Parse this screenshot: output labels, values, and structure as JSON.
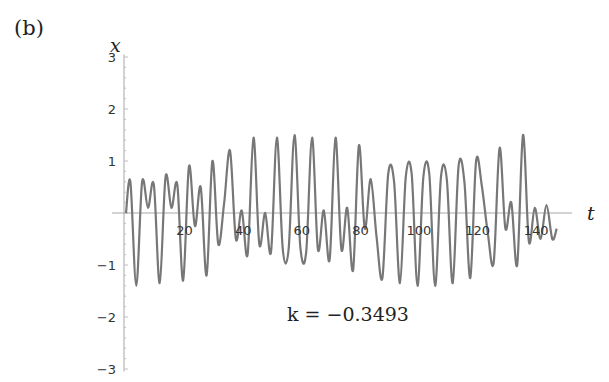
{
  "panel_label": "(b)",
  "chart_data": {
    "type": "line",
    "title": "",
    "xlabel": "t",
    "ylabel": "x",
    "xlim": [
      0,
      150
    ],
    "ylim": [
      -3,
      3
    ],
    "x_ticks": [
      20,
      40,
      60,
      80,
      100,
      120,
      140
    ],
    "y_ticks": [
      -3,
      -2,
      -1,
      1,
      2,
      3
    ],
    "grid": false,
    "legend": null,
    "annotation": "k = −0.3493",
    "series": [
      {
        "name": "x(t)",
        "color": "#777777",
        "description": "Quasi-periodic oscillation; amplitude ~0.6 for t<30, grows to ~1.5 peaks for t 35-75, moderate ~0.7 for t 85-125, large peaks ~1.4-1.5 near t 135-145",
        "x": [
          0,
          1.5,
          3.5,
          5.5,
          7.5,
          9.5,
          11.5,
          13.5,
          15.5,
          17.5,
          19.5,
          21.5,
          23.5,
          25.5,
          27.5,
          29.5,
          31.5,
          33.5,
          35.5,
          37.5,
          39.5,
          41.5,
          43.5,
          45.5,
          47.5,
          49.5,
          51.5,
          53.5,
          55.5,
          57.5,
          59.5,
          61.5,
          63.5,
          65.5,
          67.5,
          69.5,
          71.5,
          73.5,
          75.5,
          77.5,
          79.5,
          81.5,
          83.5,
          85.5,
          87.5,
          89.5,
          91.5,
          93.5,
          95.5,
          97.5,
          99.5,
          101.5,
          103.5,
          105.5,
          107.5,
          109.5,
          111.5,
          113.5,
          115.5,
          117.5,
          119.5,
          121.5,
          123.5,
          125.5,
          127.5,
          129.5,
          131.5,
          133.5,
          135.5,
          137.5,
          139.5,
          141.5,
          143.5,
          145.5,
          147
        ],
        "values": [
          0,
          0.6,
          -1.4,
          0.6,
          0.1,
          0.55,
          -1.35,
          0.7,
          0.1,
          0.55,
          -1.3,
          0.9,
          -0.25,
          0.5,
          -1.2,
          1.0,
          -0.6,
          0.2,
          1.2,
          -0.5,
          0.05,
          -0.8,
          1.45,
          -0.6,
          0.0,
          -0.75,
          1.45,
          -0.7,
          -0.7,
          1.5,
          -0.65,
          -0.75,
          1.45,
          -0.7,
          0.05,
          -0.9,
          1.45,
          -0.7,
          0.1,
          -1.1,
          1.3,
          -0.3,
          0.65,
          -0.45,
          -1.25,
          0.75,
          0.6,
          -1.35,
          0.7,
          0.75,
          -1.4,
          0.7,
          0.75,
          -1.4,
          0.7,
          0.65,
          -1.35,
          0.9,
          0.6,
          -1.25,
          1.0,
          0.5,
          -0.4,
          -0.95,
          1.25,
          -0.3,
          0.2,
          -1.0,
          1.5,
          -0.55,
          0.1,
          -0.5,
          0.15,
          -0.5,
          -0.3
        ]
      }
    ]
  }
}
